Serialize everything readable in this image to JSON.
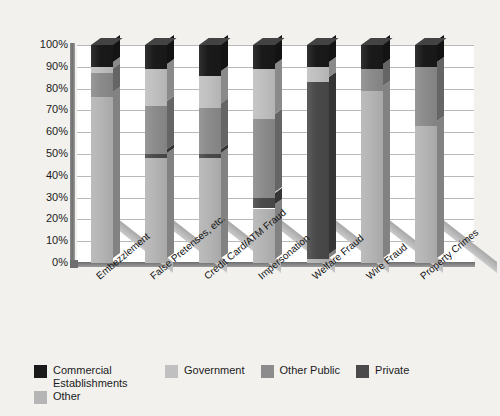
{
  "chart_data": {
    "type": "bar",
    "title": "",
    "subtitle": "",
    "xlabel": "",
    "ylabel": "",
    "stacked": true,
    "percent_stacked": true,
    "grid": true,
    "legend_position": "bottom",
    "ylim": [
      0,
      100
    ],
    "ytick_labels": [
      "100%",
      "90%",
      "80%",
      "70%",
      "60%",
      "50%",
      "40%",
      "30%",
      "20%",
      "10%",
      "0%"
    ],
    "ytick_values": [
      100,
      90,
      80,
      70,
      60,
      50,
      40,
      30,
      20,
      10,
      0
    ],
    "categories": [
      "Embezzlement",
      "False Pretenses, etc.",
      "Credit Card/ATM Fraud",
      "Impersonation",
      "Welfare Fraud",
      "Wire Fraud",
      "Property Crimes"
    ],
    "series": [
      {
        "name": "Commercial Establishments",
        "color": "#1a1a1a",
        "values": [
          10,
          11,
          14,
          11,
          10,
          11,
          10
        ]
      },
      {
        "name": "Government",
        "color": "#c0c0c0",
        "values": [
          3,
          17,
          15,
          23,
          7,
          0,
          0
        ]
      },
      {
        "name": "Other Public",
        "color": "#8c8c8c",
        "values": [
          11,
          22,
          21,
          36,
          0,
          10,
          27
        ]
      },
      {
        "name": "Private",
        "color": "#4a4a4a",
        "values": [
          0,
          2,
          2,
          5,
          81,
          0,
          0
        ]
      },
      {
        "name": "Other",
        "color": "#b5b5b5",
        "values": [
          76,
          48,
          48,
          25,
          2,
          79,
          63
        ]
      }
    ],
    "colors": {
      "commercial_establishments": "#1a1a1a",
      "government": "#c0c0c0",
      "other_public": "#8c8c8c",
      "private": "#4a4a4a",
      "other": "#b5b5b5",
      "background": "#f2f1ee",
      "plot_background": "#ffffff",
      "gridline": "#b9b9b9",
      "axis": "#6f6f6f"
    }
  },
  "legend": {
    "items": [
      {
        "label": "Commercial Establishments",
        "color": "#1a1a1a"
      },
      {
        "label": "Government",
        "color": "#c0c0c0"
      },
      {
        "label": "Other Public",
        "color": "#8c8c8c"
      },
      {
        "label": "Private",
        "color": "#4a4a4a"
      },
      {
        "label": "Other",
        "color": "#b5b5b5"
      }
    ]
  }
}
